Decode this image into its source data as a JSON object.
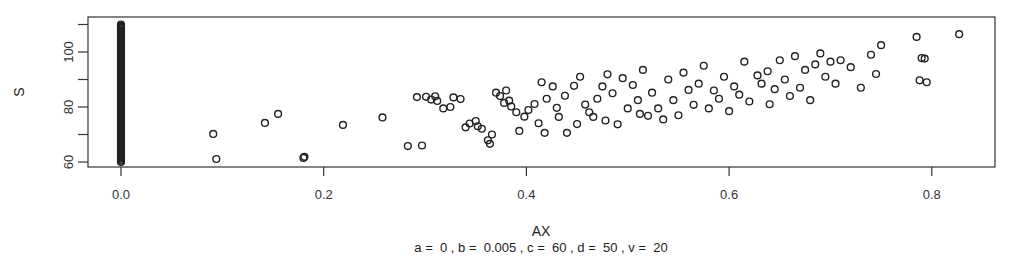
{
  "chart_data": {
    "type": "scatter",
    "title": "",
    "xlabel": "AX",
    "ylabel": "S",
    "caption": "a =  0 , b =  0.005 , c =  60 , d =  50 , v =  20",
    "xlim": [
      -0.03,
      0.86
    ],
    "ylim": [
      58.2,
      112.5
    ],
    "x_ticks": [
      0.0,
      0.2,
      0.4,
      0.6,
      0.8
    ],
    "x_tick_labels": [
      "0.0",
      "0.2",
      "0.4",
      "0.6",
      "0.8"
    ],
    "y_ticks": [
      60,
      70,
      80,
      90,
      100,
      110
    ],
    "y_tick_labels": [
      "60",
      "",
      "80",
      "",
      "100",
      ""
    ],
    "grid": false,
    "legend": null,
    "marker": "open-circle",
    "marker_color": "#222222",
    "zero_column": {
      "x": 0.0,
      "y_min": 60,
      "y_max": 110,
      "count_approx": 120
    },
    "points": [
      [
        0.0,
        60
      ],
      [
        0.0,
        61
      ],
      [
        0.0,
        62
      ],
      [
        0.0,
        63
      ],
      [
        0.0,
        64
      ],
      [
        0.0,
        65
      ],
      [
        0.0,
        66
      ],
      [
        0.0,
        67
      ],
      [
        0.0,
        68
      ],
      [
        0.0,
        69
      ],
      [
        0.0,
        70
      ],
      [
        0.0,
        71
      ],
      [
        0.0,
        72
      ],
      [
        0.0,
        73
      ],
      [
        0.0,
        74
      ],
      [
        0.0,
        75
      ],
      [
        0.0,
        76
      ],
      [
        0.0,
        77
      ],
      [
        0.0,
        78
      ],
      [
        0.0,
        79
      ],
      [
        0.0,
        80
      ],
      [
        0.0,
        81
      ],
      [
        0.0,
        82
      ],
      [
        0.0,
        83
      ],
      [
        0.0,
        84
      ],
      [
        0.0,
        85
      ],
      [
        0.0,
        86
      ],
      [
        0.0,
        87
      ],
      [
        0.0,
        88
      ],
      [
        0.0,
        89
      ],
      [
        0.0,
        90
      ],
      [
        0.0,
        91
      ],
      [
        0.0,
        92
      ],
      [
        0.0,
        93
      ],
      [
        0.0,
        94
      ],
      [
        0.0,
        95
      ],
      [
        0.0,
        96
      ],
      [
        0.0,
        97
      ],
      [
        0.0,
        98
      ],
      [
        0.0,
        99
      ],
      [
        0.0,
        100
      ],
      [
        0.0,
        101
      ],
      [
        0.0,
        102
      ],
      [
        0.0,
        103
      ],
      [
        0.0,
        104
      ],
      [
        0.0,
        105
      ],
      [
        0.0,
        106
      ],
      [
        0.0,
        107
      ],
      [
        0.0,
        108
      ],
      [
        0.0,
        109
      ],
      [
        0.0,
        110
      ],
      [
        0.091,
        70.2
      ],
      [
        0.094,
        61.1
      ],
      [
        0.142,
        74.2
      ],
      [
        0.155,
        77.5
      ],
      [
        0.18,
        61.5
      ],
      [
        0.181,
        61.9
      ],
      [
        0.219,
        73.5
      ],
      [
        0.258,
        76.2
      ],
      [
        0.283,
        65.8
      ],
      [
        0.292,
        83.6
      ],
      [
        0.297,
        66.0
      ],
      [
        0.301,
        83.7
      ],
      [
        0.306,
        82.7
      ],
      [
        0.31,
        83.9
      ],
      [
        0.312,
        82.2
      ],
      [
        0.318,
        79.5
      ],
      [
        0.325,
        80.0
      ],
      [
        0.328,
        83.5
      ],
      [
        0.335,
        82.9
      ],
      [
        0.34,
        72.6
      ],
      [
        0.344,
        74.0
      ],
      [
        0.35,
        74.9
      ],
      [
        0.352,
        73.0
      ],
      [
        0.356,
        72.1
      ],
      [
        0.362,
        67.9
      ],
      [
        0.364,
        66.6
      ],
      [
        0.366,
        70.0
      ],
      [
        0.37,
        85.2
      ],
      [
        0.374,
        84.0
      ],
      [
        0.378,
        81.5
      ],
      [
        0.38,
        86.0
      ],
      [
        0.383,
        82.3
      ],
      [
        0.385,
        80.2
      ],
      [
        0.39,
        78.1
      ],
      [
        0.393,
        71.3
      ],
      [
        0.398,
        76.5
      ],
      [
        0.402,
        78.9
      ],
      [
        0.408,
        81.1
      ],
      [
        0.412,
        74.1
      ],
      [
        0.415,
        89.0
      ],
      [
        0.418,
        70.6
      ],
      [
        0.42,
        83.0
      ],
      [
        0.426,
        87.5
      ],
      [
        0.43,
        79.7
      ],
      [
        0.432,
        76.4
      ],
      [
        0.438,
        84.1
      ],
      [
        0.44,
        70.6
      ],
      [
        0.447,
        87.7
      ],
      [
        0.45,
        73.8
      ],
      [
        0.453,
        91.0
      ],
      [
        0.458,
        80.9
      ],
      [
        0.462,
        78.1
      ],
      [
        0.466,
        76.4
      ],
      [
        0.47,
        83.0
      ],
      [
        0.475,
        87.5
      ],
      [
        0.478,
        75.1
      ],
      [
        0.48,
        91.9
      ],
      [
        0.485,
        85.0
      ],
      [
        0.49,
        73.7
      ],
      [
        0.495,
        90.5
      ],
      [
        0.5,
        79.5
      ],
      [
        0.505,
        88.0
      ],
      [
        0.51,
        82.5
      ],
      [
        0.512,
        77.5
      ],
      [
        0.515,
        93.5
      ],
      [
        0.52,
        76.8
      ],
      [
        0.524,
        85.2
      ],
      [
        0.53,
        79.5
      ],
      [
        0.535,
        75.5
      ],
      [
        0.54,
        90.0
      ],
      [
        0.545,
        82.5
      ],
      [
        0.55,
        77.0
      ],
      [
        0.555,
        92.5
      ],
      [
        0.56,
        86.2
      ],
      [
        0.565,
        80.8
      ],
      [
        0.57,
        88.5
      ],
      [
        0.575,
        95.0
      ],
      [
        0.58,
        79.5
      ],
      [
        0.585,
        86.0
      ],
      [
        0.59,
        83.0
      ],
      [
        0.595,
        91.0
      ],
      [
        0.6,
        78.5
      ],
      [
        0.605,
        87.5
      ],
      [
        0.61,
        84.5
      ],
      [
        0.615,
        96.5
      ],
      [
        0.62,
        82.0
      ],
      [
        0.628,
        91.5
      ],
      [
        0.632,
        88.5
      ],
      [
        0.638,
        93.0
      ],
      [
        0.64,
        81.0
      ],
      [
        0.645,
        86.5
      ],
      [
        0.65,
        97.0
      ],
      [
        0.655,
        90.0
      ],
      [
        0.66,
        84.0
      ],
      [
        0.665,
        98.5
      ],
      [
        0.67,
        87.0
      ],
      [
        0.675,
        93.5
      ],
      [
        0.68,
        82.5
      ],
      [
        0.685,
        95.5
      ],
      [
        0.69,
        99.5
      ],
      [
        0.695,
        91.0
      ],
      [
        0.7,
        96.5
      ],
      [
        0.705,
        88.5
      ],
      [
        0.71,
        97.0
      ],
      [
        0.72,
        94.5
      ],
      [
        0.73,
        87.0
      ],
      [
        0.74,
        99.0
      ],
      [
        0.745,
        92.0
      ],
      [
        0.75,
        102.5
      ],
      [
        0.785,
        105.5
      ],
      [
        0.788,
        89.7
      ],
      [
        0.79,
        97.8
      ],
      [
        0.793,
        97.6
      ],
      [
        0.795,
        89.0
      ],
      [
        0.827,
        106.5
      ]
    ]
  }
}
